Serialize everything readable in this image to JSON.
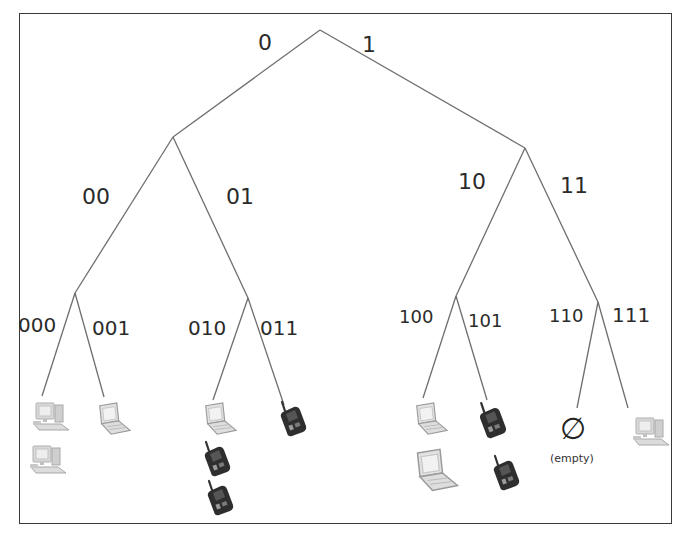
{
  "diagram": {
    "type": "binary-trie",
    "edge_color": "#6e6e6e",
    "frame_color": "#3a3a3a",
    "edges": {
      "level1": [
        "0",
        "1"
      ],
      "level2": [
        "00",
        "01",
        "10",
        "11"
      ],
      "level3": [
        "000",
        "001",
        "010",
        "011",
        "100",
        "101",
        "110",
        "111"
      ]
    },
    "leaves": [
      {
        "prefix": "000",
        "devices": [
          "desktop",
          "desktop"
        ]
      },
      {
        "prefix": "001",
        "devices": [
          "laptop"
        ]
      },
      {
        "prefix": "010",
        "devices": [
          "laptop",
          "phone",
          "phone"
        ]
      },
      {
        "prefix": "011",
        "devices": [
          "phone"
        ]
      },
      {
        "prefix": "100",
        "devices": [
          "laptop",
          "laptop"
        ]
      },
      {
        "prefix": "101",
        "devices": [
          "phone",
          "phone"
        ]
      },
      {
        "prefix": "110",
        "devices": [],
        "empty_symbol": "∅",
        "empty_label": "(empty)"
      },
      {
        "prefix": "111",
        "devices": [
          "desktop"
        ]
      }
    ]
  }
}
